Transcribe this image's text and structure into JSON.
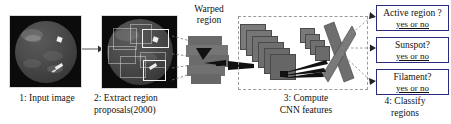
{
  "figure": {
    "type": "pipeline-diagram"
  },
  "steps": [
    {
      "id": "input-image",
      "caption_lines": [
        "1: Input image"
      ],
      "panel": "solar full-disk grayscale image"
    },
    {
      "id": "extract-region-proposals",
      "caption_lines": [
        "2: Extract region",
        "proposals(2000)"
      ],
      "panel": "solar disk with candidate proposal rectangles"
    },
    {
      "id": "compute-cnn-features",
      "caption_lines": [
        "3: Compute",
        "CNN features"
      ],
      "panel": "stack of convolutional feature maps"
    },
    {
      "id": "classify-regions",
      "caption_lines": [
        "4: Classify",
        "regions"
      ],
      "panel": "classifier output boxes"
    }
  ],
  "warped": {
    "label_lines": [
      "Warped",
      "region"
    ]
  },
  "classifiers": [
    {
      "question": "Active region ?",
      "answer": "yes or no"
    },
    {
      "question": "Sunspot?",
      "answer": "yes or no"
    },
    {
      "question": "Filament?",
      "answer": "yes or no"
    }
  ],
  "colors": {
    "classifier_border": "#2b2b82",
    "panel_background": "#0b0b0b",
    "cnn_layer": "#6f6f6f",
    "dashed_frame": "#9a9a9a",
    "page_background": "#ffffff"
  }
}
